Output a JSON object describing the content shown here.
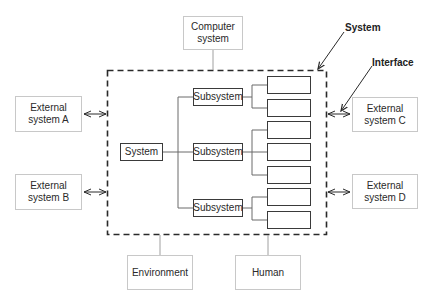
{
  "diagram": {
    "annotations": {
      "system": "System",
      "interface": "Interface"
    },
    "outer_nodes": {
      "computer_system": "Computer system",
      "external_a": "External system A",
      "external_b": "External system B",
      "external_c": "External system C",
      "external_d": "External system D",
      "environment": "Environment",
      "human": "Human"
    },
    "inner_nodes": {
      "root": "System",
      "subsystems": [
        "Subsystem",
        "Subsystem",
        "Subsystem"
      ],
      "leaf_count": 7
    },
    "colors": {
      "boundary": "#2a2a2a",
      "outer_border": "#c8c8c8",
      "inner_border": "#3a3a3a",
      "connector": "#8a8a8a"
    }
  }
}
